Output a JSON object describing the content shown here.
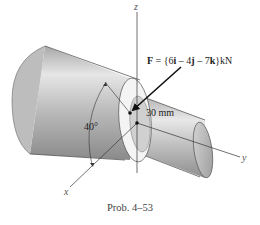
{
  "figure": {
    "caption": "Prob. 4–53",
    "force": {
      "symbol": "F",
      "equals": " = {",
      "i_coef": "6",
      "i_unit": "i",
      "j_sep": " – ",
      "j_coef": "4",
      "j_unit": "j",
      "k_sep": " – ",
      "k_coef": "7",
      "k_unit": "k",
      "close": "}kN"
    },
    "dimension": "30 mm",
    "angle": "40°",
    "axes": {
      "x": "x",
      "y": "y",
      "z": "z"
    }
  },
  "colors": {
    "cylinder_dark": "#8c8c8c",
    "cylinder_mid": "#c4c4c4",
    "cylinder_light": "#ececec",
    "line": "#333333"
  }
}
